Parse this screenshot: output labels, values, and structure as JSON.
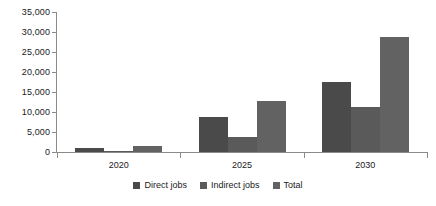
{
  "chart_data": {
    "type": "bar",
    "title": "",
    "subtitle": "",
    "xlabel": "",
    "ylabel": "",
    "categories": [
      "2020",
      "2025",
      "2030"
    ],
    "series": [
      {
        "name": "Direct jobs",
        "values": [
          1000,
          8800,
          17400
        ],
        "color": "#4a4a4a"
      },
      {
        "name": "Indirect jobs",
        "values": [
          300,
          3800,
          11300
        ],
        "color": "#5a5a5a"
      },
      {
        "name": "Total",
        "values": [
          1400,
          12800,
          28800
        ],
        "color": "#626262"
      }
    ],
    "ylim": [
      0,
      35000
    ],
    "ytick_values": [
      0,
      5000,
      10000,
      15000,
      20000,
      25000,
      30000,
      35000
    ],
    "ytick_labels": [
      "0",
      "5,000",
      "10,000",
      "15,000",
      "20,000",
      "25,000",
      "30,000",
      "35,000"
    ],
    "grid": false,
    "legend_position": "bottom",
    "bar_grouping": "grouped",
    "background_color": "#ffffff",
    "axis_color": "#8a8a8a"
  },
  "legend": {
    "items": [
      {
        "label": "Direct jobs"
      },
      {
        "label": "Indirect jobs"
      },
      {
        "label": "Total"
      }
    ]
  }
}
